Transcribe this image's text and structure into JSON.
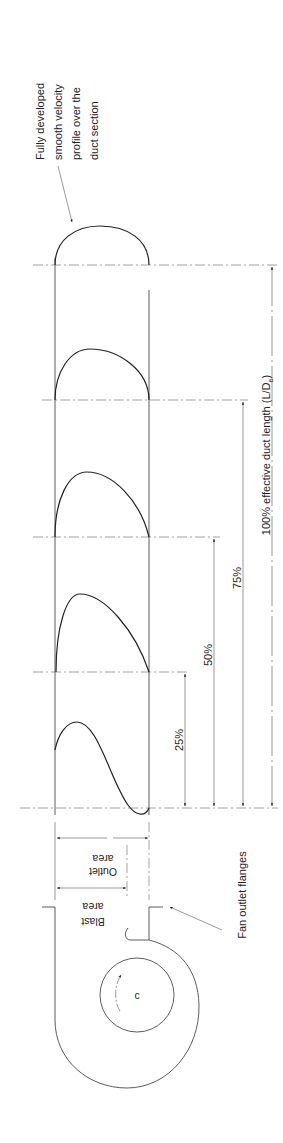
{
  "diagram": {
    "labels": {
      "profile_note": [
        "Fully developed",
        "smooth velocity",
        "profile over the",
        "duct section"
      ],
      "pct_25": "25%",
      "pct_50": "50%",
      "pct_75": "75%",
      "pct_100": "100% effective duct length (L/D",
      "pct_100_sub": "e",
      "pct_100_close": ")",
      "outlet_area": [
        "Outlet",
        "area"
      ],
      "blast_area": [
        "Blast",
        "area"
      ],
      "fan_outlet_flanges": "Fan outlet flanges",
      "impeller_center": "c"
    },
    "stations": [
      {
        "id": "fan-outlet",
        "position_pct": 0,
        "profile": "skewed with reverse flow"
      },
      {
        "id": "station-25",
        "position_pct": 25,
        "profile": "skewed"
      },
      {
        "id": "station-50",
        "position_pct": 50,
        "profile": "less skewed"
      },
      {
        "id": "station-75",
        "position_pct": 75,
        "profile": "nearly uniform"
      },
      {
        "id": "station-100",
        "position_pct": 100,
        "profile": "fully developed"
      }
    ],
    "colors": {
      "line": "#333333",
      "background": "#ffffff"
    }
  }
}
